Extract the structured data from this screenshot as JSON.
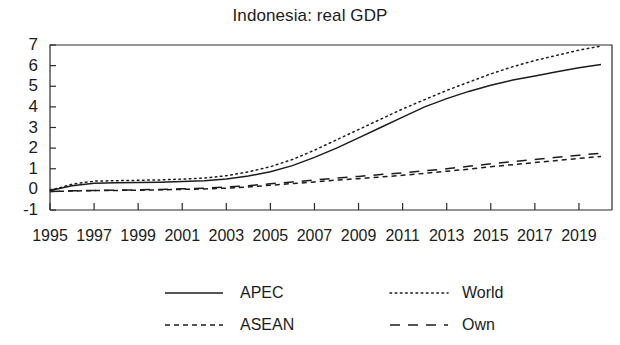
{
  "chart_data": {
    "type": "line",
    "title": "Indonesia: real GDP",
    "xlabel": "",
    "ylabel": "",
    "xlim": [
      1995,
      2020.5
    ],
    "ylim": [
      -1,
      7
    ],
    "grid": false,
    "legend_position": "bottom",
    "x": [
      1995,
      1996,
      1997,
      1998,
      1999,
      2000,
      2001,
      2002,
      2003,
      2004,
      2005,
      2006,
      2007,
      2008,
      2009,
      2010,
      2011,
      2012,
      2013,
      2014,
      2015,
      2016,
      2017,
      2018,
      2019,
      2020
    ],
    "xticks": [
      1995,
      1997,
      1999,
      2001,
      2003,
      2005,
      2007,
      2009,
      2011,
      2013,
      2015,
      2017,
      2019
    ],
    "xtick_labels": [
      "1995",
      "1997",
      "1999",
      "2001",
      "2003",
      "2005",
      "2007",
      "2009",
      "2011",
      "2013",
      "2015",
      "2017",
      "2019"
    ],
    "yticks": [
      -1,
      0,
      1,
      2,
      3,
      4,
      5,
      6,
      7
    ],
    "ytick_labels": [
      "-1",
      "0",
      "1",
      "2",
      "3",
      "4",
      "5",
      "6",
      "7"
    ],
    "series": [
      {
        "name": "APEC",
        "style": "solid",
        "values": [
          -0.05,
          0.18,
          0.3,
          0.32,
          0.33,
          0.35,
          0.38,
          0.42,
          0.5,
          0.65,
          0.85,
          1.15,
          1.55,
          2.0,
          2.5,
          3.0,
          3.5,
          4.0,
          4.4,
          4.75,
          5.05,
          5.3,
          5.5,
          5.7,
          5.9,
          6.05
        ]
      },
      {
        "name": "World",
        "style": "dotted",
        "values": [
          -0.05,
          0.25,
          0.4,
          0.42,
          0.44,
          0.46,
          0.5,
          0.55,
          0.66,
          0.85,
          1.1,
          1.45,
          1.9,
          2.4,
          2.9,
          3.4,
          3.9,
          4.35,
          4.8,
          5.2,
          5.6,
          5.95,
          6.25,
          6.5,
          6.75,
          6.95
        ]
      },
      {
        "name": "ASEAN",
        "style": "dashed-short",
        "values": [
          -0.1,
          -0.08,
          -0.06,
          -0.05,
          -0.04,
          -0.02,
          0.0,
          0.02,
          0.06,
          0.12,
          0.2,
          0.28,
          0.36,
          0.45,
          0.52,
          0.6,
          0.68,
          0.78,
          0.88,
          0.98,
          1.1,
          1.2,
          1.3,
          1.4,
          1.5,
          1.6
        ]
      },
      {
        "name": "Own",
        "style": "dashed-long",
        "values": [
          -0.1,
          -0.07,
          -0.05,
          -0.04,
          -0.02,
          0.0,
          0.03,
          0.06,
          0.11,
          0.18,
          0.27,
          0.36,
          0.45,
          0.55,
          0.63,
          0.72,
          0.8,
          0.9,
          1.0,
          1.12,
          1.24,
          1.35,
          1.45,
          1.56,
          1.66,
          1.75
        ]
      }
    ]
  },
  "legend": {
    "entries": [
      {
        "label": "APEC",
        "style": "solid"
      },
      {
        "label": "World",
        "style": "dotted"
      },
      {
        "label": "ASEAN",
        "style": "dashed-short"
      },
      {
        "label": "Own",
        "style": "dashed-long"
      }
    ]
  },
  "colors": {
    "ink": "#1c1c1c",
    "axis": "#2b2b2b",
    "background": "#ffffff"
  }
}
